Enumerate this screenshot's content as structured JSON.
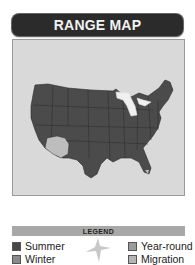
{
  "header": {
    "title": "RANGE MAP"
  },
  "map": {
    "region": "contiguous-united-states",
    "range_colors": {
      "summer": "#4a4a4a",
      "winter": "#bdbdbd",
      "background": "#d9d9d9",
      "great_lakes": "#f0f0f0"
    }
  },
  "legend": {
    "title": "LEGEND",
    "items": [
      {
        "label": "Summer",
        "color": "#474747"
      },
      {
        "label": "Winter",
        "color": "#8a8a8a"
      },
      {
        "label": "Year-round",
        "color": "#9c9c9c"
      },
      {
        "label": "Migration",
        "color": "#b5b5b5"
      }
    ],
    "icon": "bird-silhouette-icon"
  }
}
